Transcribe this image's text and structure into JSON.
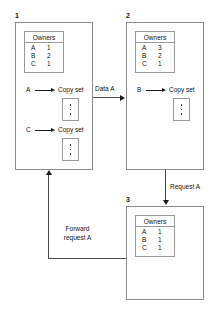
{
  "diagram": {
    "colors": {
      "panel_border": "#8c8c8c",
      "box_border": "#9a9a9a",
      "arrow": "#1a1a1a",
      "connector": "#4a4a4a",
      "text": "#111111",
      "background": "#ffffff"
    },
    "panels": [
      {
        "number": "1",
        "owners": {
          "header": "Owners",
          "rows": [
            {
              "key": "A",
              "value": "1"
            },
            {
              "key": "B",
              "value": "2"
            },
            {
              "key": "C",
              "value": "1"
            }
          ]
        },
        "copy_sets": [
          {
            "source": "A",
            "label": "Copy set",
            "dots": 3
          },
          {
            "source": "C",
            "label": "Copy set",
            "dots": 3
          }
        ]
      },
      {
        "number": "2",
        "owners": {
          "header": "Owners",
          "rows": [
            {
              "key": "A",
              "value": "3"
            },
            {
              "key": "B",
              "value": "2"
            },
            {
              "key": "C",
              "value": "1"
            }
          ]
        },
        "copy_sets": [
          {
            "source": "B",
            "label": "Copy set",
            "dots": 3
          }
        ]
      },
      {
        "number": "3",
        "owners": {
          "header": "Owners",
          "rows": [
            {
              "key": "A",
              "value": "1"
            },
            {
              "key": "B",
              "value": "1"
            },
            {
              "key": "C",
              "value": "1"
            }
          ]
        },
        "copy_sets": []
      }
    ],
    "connectors": [
      {
        "id": "data-a",
        "label": "Data A",
        "from": "1",
        "to": "2",
        "direction": "right"
      },
      {
        "id": "request-a",
        "label": "Request A",
        "from": "2",
        "to": "3",
        "direction": "down"
      },
      {
        "id": "forward-request-a",
        "label_line1": "Forward",
        "label_line2": "request A",
        "from": "3",
        "to": "1",
        "direction": "up"
      }
    ]
  }
}
